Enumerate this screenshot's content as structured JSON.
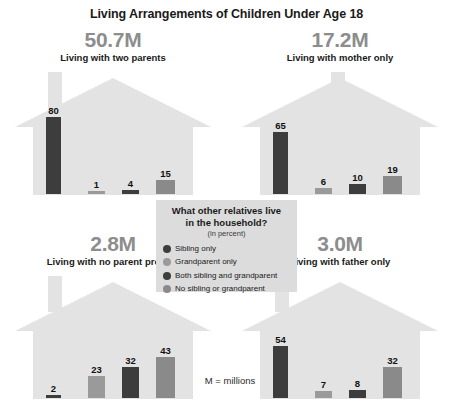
{
  "title": "Living Arrangements of Children Under Age 18",
  "footnote": "M = millions",
  "legend": {
    "title_line1": "What other relatives live",
    "title_line2": "in the household?",
    "subtitle": "(in percent)",
    "items": [
      {
        "label": "Sibling only",
        "color": "#3d3d3d"
      },
      {
        "label": "Grandparent only",
        "color": "#9a9a9a"
      },
      {
        "label": "Both sibling and grandparent",
        "color": "#3d3d3d"
      },
      {
        "label": "No sibling or grandparent",
        "color": "#8a8a8a"
      }
    ]
  },
  "panels": [
    {
      "amount": "50.7M",
      "caption": "Living with two parents",
      "chimney": "left",
      "values": [
        "80",
        "1",
        "4",
        "15"
      ]
    },
    {
      "amount": "17.2M",
      "caption": "Living with mother only",
      "chimney": "center",
      "values": [
        "65",
        "6",
        "10",
        "19"
      ]
    },
    {
      "amount": "2.8M",
      "caption": "Living with no parent present",
      "chimney": "left",
      "values": [
        "2",
        "23",
        "32",
        "43"
      ]
    },
    {
      "amount": "3.0M",
      "caption": "Living with father only",
      "chimney": "left",
      "values": [
        "54",
        "7",
        "8",
        "32"
      ]
    }
  ],
  "chart_data": {
    "type": "bar",
    "title": "Living Arrangements of Children Under Age 18",
    "subtitle": "What other relatives live in the household? (in percent)",
    "xlabel": "",
    "ylabel": "Percent",
    "ylim": [
      0,
      100
    ],
    "grid": false,
    "legend_position": "center",
    "note": "M = millions",
    "categories": [
      "Sibling only",
      "Grandparent only",
      "Both sibling and grandparent",
      "No sibling or grandparent"
    ],
    "series": [
      {
        "name": "Living with two parents",
        "total": "50.7M",
        "values": [
          80,
          1,
          4,
          15
        ]
      },
      {
        "name": "Living with mother only",
        "total": "17.2M",
        "values": [
          65,
          6,
          10,
          19
        ]
      },
      {
        "name": "Living with no parent present",
        "total": "2.8M",
        "values": [
          2,
          23,
          32,
          43
        ]
      },
      {
        "name": "Living with father only",
        "total": "3.0M",
        "values": [
          54,
          7,
          8,
          32
        ]
      }
    ],
    "colors": [
      "#3d3d3d",
      "#9a9a9a",
      "#3d3d3d",
      "#8a8a8a"
    ]
  }
}
